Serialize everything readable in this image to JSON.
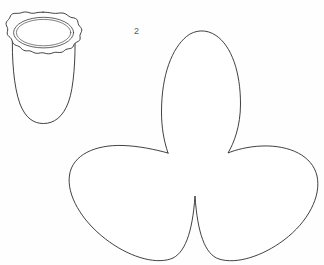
{
  "page": {
    "background_color": "#fefefe",
    "ink_color": "#2b2b2b",
    "width": 324,
    "height": 265
  },
  "labels": {
    "trefoil_number": "2"
  },
  "shapes": [
    {
      "id": "flowerpot",
      "name": "flowerpot-with-scalloped-rim",
      "description": "Line drawing of a tapered pot or cup with a wavy scalloped rim and rounded bottom",
      "bounds": {
        "x": 3,
        "y": 12,
        "width": 79,
        "height": 112
      }
    },
    {
      "id": "trefoil",
      "name": "trefoil-three-lobe-shape",
      "description": "Three-lobed clover / propeller outline with one upper lobe and two lower side lobes meeting at cusps",
      "bounds": {
        "x": 68,
        "y": 30,
        "width": 249,
        "height": 233
      },
      "lobes": 3,
      "cusps": [
        {
          "x": 168,
          "y": 153
        },
        {
          "x": 218,
          "y": 153
        },
        {
          "x": 195,
          "y": 196
        }
      ]
    }
  ]
}
